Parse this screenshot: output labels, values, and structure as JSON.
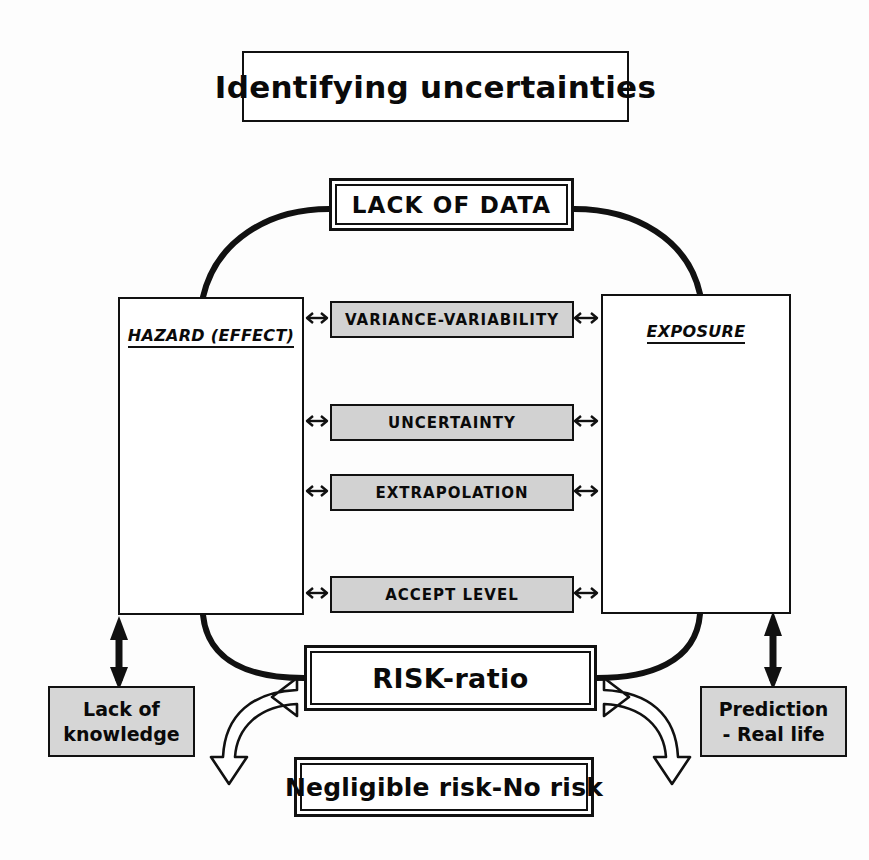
{
  "title": {
    "text": "Identifying uncertainties"
  },
  "top_node": {
    "label": "LACK OF DATA"
  },
  "left_panel": {
    "title": "HAZARD (EFFECT)",
    "boxes": [
      {
        "label": "Toxicity"
      },
      {
        "label": "Extrapolation"
      },
      {
        "label": "Zero-effect"
      }
    ]
  },
  "right_panel": {
    "title": "EXPOSURE",
    "boxes": [
      {
        "label": "Emission"
      },
      {
        "label": "Distribution"
      },
      {
        "label": "Exposure"
      }
    ]
  },
  "center_bars": [
    {
      "label": "VARIANCE-VARIABILITY"
    },
    {
      "label": "UNCERTAINTY"
    },
    {
      "label": "EXTRAPOLATION"
    },
    {
      "label": "ACCEPT LEVEL"
    }
  ],
  "bottom_node": {
    "label": "RISK-ratio"
  },
  "outcome_node": {
    "label": "Negligible risk-No risk"
  },
  "left_footnote": {
    "line1": "Lack of",
    "line2": "knowledge"
  },
  "right_footnote": {
    "line1": "Prediction",
    "line2": "- Real life"
  },
  "colors": {
    "ink": "#111111",
    "page": "#fdfdfd",
    "bar_fill": "#d2d2d2",
    "label_fill": "#d6d6d6",
    "iso_fill": "#e8e8e8"
  },
  "icons": {
    "bidirectional_arrow": "double-headed-arrow",
    "vertical_bidirectional_arrow": "vertical-double-headed-arrow",
    "block_arrow": "hollow-curved-block-arrow"
  }
}
